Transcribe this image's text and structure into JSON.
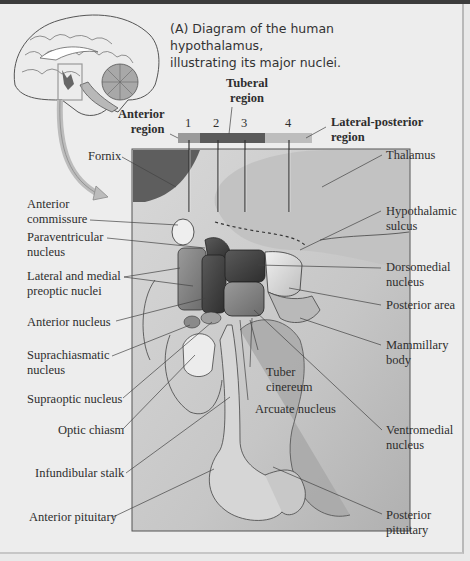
{
  "caption": {
    "line1": "(A) Diagram of the human hypothalamus,",
    "line2": "illustrating its major nuclei."
  },
  "regions": {
    "anterior": [
      "Anterior",
      "region"
    ],
    "tuberal": [
      "Tuberal",
      "region"
    ],
    "lateral_posterior": [
      "Lateral-posterior",
      "region"
    ]
  },
  "region_bar_colors": {
    "anterior": "#9a9a9a",
    "tuberal": "#5a5a5a",
    "lateral_posterior": "#bdbdbd"
  },
  "section_numbers": [
    "1",
    "2",
    "3",
    "4"
  ],
  "labels_left": [
    [
      "Fornix"
    ],
    [
      "Anterior",
      "commissure"
    ],
    [
      "Paraventricular",
      "nucleus"
    ],
    [
      "Lateral and medial",
      "preoptic nuclei"
    ],
    [
      "Anterior nucleus"
    ],
    [
      "Suprachiasmatic",
      "nucleus"
    ],
    [
      "Supraoptic nucleus"
    ],
    [
      "Optic chiasm"
    ],
    [
      "Infundibular stalk"
    ],
    [
      "Anterior pituitary"
    ]
  ],
  "labels_right": [
    [
      "Thalamus"
    ],
    [
      "Hypothalamic",
      "sulcus"
    ],
    [
      "Dorsomedial",
      "nucleus"
    ],
    [
      "Posterior area"
    ],
    [
      "Mammillary",
      "body"
    ],
    [
      "Ventromedial",
      "nucleus"
    ],
    [
      "Posterior",
      "pituitary"
    ]
  ],
  "labels_inner": {
    "tuber_cinereum": [
      "Tuber",
      "cinereum"
    ],
    "arcuate_nucleus": "Arcuate nucleus"
  }
}
